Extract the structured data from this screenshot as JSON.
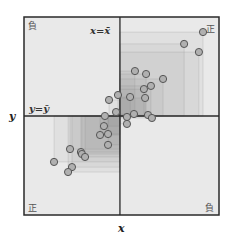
{
  "chart_data": {
    "type": "scatter",
    "title": "",
    "xlabel": "x",
    "ylabel": "y",
    "xlim": [
      0,
      100
    ],
    "ylim": [
      0,
      100
    ],
    "grid": false,
    "legend": null,
    "mean_lines": {
      "x_mean": 49.2,
      "y_mean": 50.0,
      "x_mean_label": "x=x̄",
      "y_mean_label": "y=ȳ"
    },
    "quadrant_labels": {
      "top_left": "負",
      "top_right": "正",
      "bottom_left": "正",
      "bottom_right": "負"
    },
    "annotations": [
      "deviation rectangles drawn from each point to the mean intersection"
    ],
    "series": [
      {
        "name": "points",
        "x": [
          91.8,
          82.1,
          89.7,
          56.9,
          62.6,
          71.3,
          65.1,
          61.5,
          62.1,
          54.4,
          48.2,
          43.6,
          47.2,
          56.4,
          52.8,
          52.8,
          63.6,
          65.6,
          41.5,
          41.0,
          39.0,
          43.1,
          43.1,
          23.6,
          29.2,
          29.7,
          31.3,
          15.4,
          24.6,
          22.6
        ],
        "y": [
          92.4,
          86.4,
          82.3,
          72.7,
          71.2,
          68.7,
          65.2,
          63.6,
          59.1,
          59.6,
          60.6,
          58.1,
          52.0,
          51.0,
          49.5,
          46.0,
          50.5,
          49.0,
          50.0,
          44.9,
          40.4,
          40.9,
          35.4,
          33.3,
          31.8,
          30.8,
          29.3,
          26.8,
          24.2,
          21.7
        ]
      }
    ]
  },
  "colors": {
    "background": "#e9e9e9",
    "frame": "#2a2a2a",
    "rect_fill": "#7a7a7a",
    "point_fill": "#b0b0b0",
    "point_stroke": "#555555"
  },
  "labels": {
    "x_axis": "x",
    "y_axis": "y",
    "x_mean": "x=x̄",
    "y_mean": "y=ȳ",
    "q_top_left": "負",
    "q_top_right": "正",
    "q_bottom_left": "正",
    "q_bottom_right": "負"
  }
}
